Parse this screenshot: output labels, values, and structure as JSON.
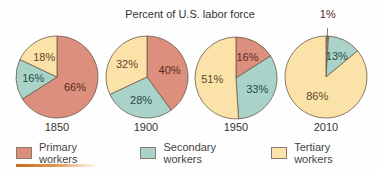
{
  "chart_data": {
    "type": "pie",
    "title": "Percent of U.S. labor force",
    "categories": [
      "Primary workers",
      "Secondary workers",
      "Tertiary workers"
    ],
    "colors": [
      "#dc8f7c",
      "#a9d3c8",
      "#fbe2a8"
    ],
    "pies": [
      {
        "year": "1850",
        "values": {
          "primary": 66,
          "secondary": 16,
          "tertiary": 18
        },
        "labels": [
          "66%",
          "16%",
          "18%"
        ]
      },
      {
        "year": "1900",
        "values": {
          "primary": 40,
          "secondary": 28,
          "tertiary": 32
        },
        "labels": [
          "40%",
          "28%",
          "32%"
        ]
      },
      {
        "year": "1950",
        "values": {
          "primary": 16,
          "secondary": 33,
          "tertiary": 51
        },
        "labels": [
          "16%",
          "33%",
          "51%"
        ]
      },
      {
        "year": "2010",
        "values": {
          "primary": 1,
          "secondary": 13,
          "tertiary": 86
        },
        "labels": [
          "1%",
          "13%",
          "86%"
        ]
      }
    ],
    "legend_position": "bottom"
  },
  "title": "Percent of U.S. labor force",
  "years": [
    "1850",
    "1900",
    "1950",
    "2010"
  ],
  "legend": [
    {
      "label": "Primary workers",
      "color": "#dc8f7c"
    },
    {
      "label": "Secondary workers",
      "color": "#a9d3c8"
    },
    {
      "label": "Tertiary workers",
      "color": "#fbe2a8"
    }
  ]
}
